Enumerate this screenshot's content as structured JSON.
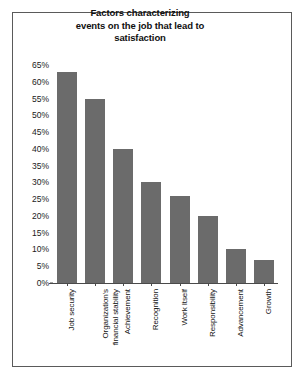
{
  "chart_data": {
    "type": "bar",
    "title_lines": [
      "Factors characterizing",
      "events on the job that lead to",
      "satisfaction"
    ],
    "xlabel": "",
    "ylabel": "",
    "ylim": [
      0,
      65
    ],
    "ytick_labels": [
      "65%",
      "60%",
      "55%",
      "50%",
      "45%",
      "40%",
      "35%",
      "30%",
      "25%",
      "20%",
      "15%",
      "10%",
      "5%",
      "0%"
    ],
    "ytick_values": [
      65,
      60,
      55,
      50,
      45,
      40,
      35,
      30,
      25,
      20,
      15,
      10,
      5,
      0
    ],
    "grid": false,
    "legend": false,
    "categories": [
      "Job security",
      "Organization's financial stability",
      "Achievement",
      "Recognition",
      "Work Itself",
      "Responsibility",
      "Advancement",
      "Growth"
    ],
    "category_label_lines": [
      [
        "Job security"
      ],
      [
        "Organization's",
        "financial stability"
      ],
      [
        "Achievement"
      ],
      [
        "Recognition"
      ],
      [
        "Work Itself"
      ],
      [
        "Responsibility"
      ],
      [
        "Advancement"
      ],
      [
        "Growth"
      ]
    ],
    "values": [
      63,
      55,
      40,
      30,
      26,
      20,
      10,
      7
    ],
    "bar_color": "#6b6b6b",
    "axis_color": "#4a4a4a",
    "frame_color": "#5a5a5a",
    "background_color": "#ffffff"
  }
}
